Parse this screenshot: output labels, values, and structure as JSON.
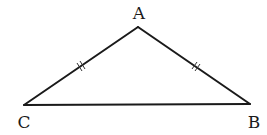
{
  "diagram": {
    "type": "isosceles-triangle",
    "vertices": {
      "A": {
        "label": "A",
        "x": 138,
        "y": 27,
        "label_x": 139,
        "label_y": 19
      },
      "B": {
        "label": "B",
        "x": 250,
        "y": 104,
        "label_x": 254,
        "label_y": 128
      },
      "C": {
        "label": "C",
        "x": 24,
        "y": 105,
        "label_x": 24,
        "label_y": 128
      }
    },
    "edges": [
      {
        "from": "A",
        "to": "C",
        "tick_marks": 2
      },
      {
        "from": "A",
        "to": "B",
        "tick_marks": 2
      },
      {
        "from": "C",
        "to": "B",
        "tick_marks": 0
      }
    ],
    "stroke_color": "#1a1a1a",
    "background": "#ffffff"
  }
}
